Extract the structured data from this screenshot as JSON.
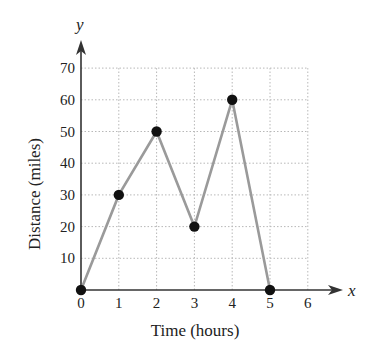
{
  "chart_data": {
    "type": "line",
    "title": "",
    "xlabel": "Time (hours)",
    "ylabel": "Distance (miles)",
    "x_axis_var": "x",
    "y_axis_var": "y",
    "x": [
      0,
      1,
      2,
      3,
      4,
      5
    ],
    "series": [
      {
        "name": "Distance",
        "values": [
          0,
          30,
          50,
          20,
          60,
          0
        ]
      }
    ],
    "xticks": [
      0,
      1,
      2,
      3,
      4,
      5,
      6
    ],
    "yticks": [
      10,
      20,
      30,
      40,
      50,
      60,
      70
    ],
    "xlim": [
      0,
      6
    ],
    "ylim": [
      0,
      70
    ],
    "grid": true,
    "grid_style": "dotted",
    "legend": "none",
    "colors": {
      "line": "#9a9a9a",
      "marker": "#111111",
      "axis": "#333333",
      "grid": "#b8b8b8"
    }
  }
}
